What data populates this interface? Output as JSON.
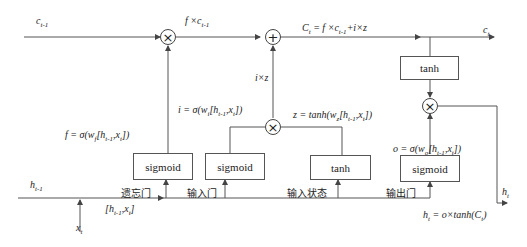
{
  "inputs": {
    "c_prev": "c t-1",
    "h_prev": "h t-1",
    "x_t": "x t",
    "concat": "[h t-1, x t]"
  },
  "outputs": {
    "c_t": "c t",
    "h_t": "h t"
  },
  "equations": {
    "forget_product": "f × c t-1",
    "cell_state": "C t = f × c t-1 + i × z",
    "input_product": "i × z",
    "input_gate": "i = σ(w i [h t-1, x t])",
    "candidate": "z = tanh(w z [h t-1, x t])",
    "forget_gate": "f = σ(w f [h t-1, x t])",
    "output_gate": "o = σ(w o [h t-1, x t])",
    "hidden": "h t = o × tanh(C t)"
  },
  "boxes": {
    "forget_sigmoid": "sigmoid",
    "input_sigmoid": "sigmoid",
    "input_tanh": "tanh",
    "output_sigmoid": "sigmoid",
    "cell_tanh": "tanh"
  },
  "gate_labels": {
    "forget": "遗忘门",
    "input": "输入门",
    "input_state": "输入状态",
    "output": "输出门"
  },
  "operators": {
    "multiply": "×",
    "add": "+"
  }
}
